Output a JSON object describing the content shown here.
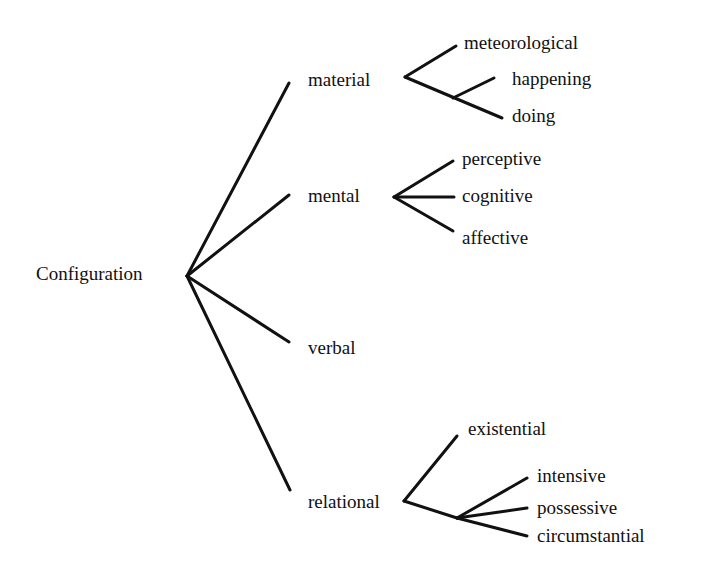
{
  "diagram": {
    "type": "tree",
    "colors": {
      "ink": "#111111",
      "background": "#ffffff"
    },
    "root": {
      "label": "Configuration"
    },
    "nodes": {
      "material": {
        "label": "material",
        "children": {
          "meteorological": "meteorological",
          "happening": "happening",
          "doing": "doing"
        }
      },
      "mental": {
        "label": "mental",
        "children": {
          "perceptive": "perceptive",
          "cognitive": "cognitive",
          "affective": "affective"
        }
      },
      "verbal": {
        "label": "verbal"
      },
      "relational": {
        "label": "relational",
        "children": {
          "existential": "existential",
          "intensive": "intensive",
          "possessive": "possessive",
          "circumstantial": "circumstantial"
        }
      }
    }
  }
}
